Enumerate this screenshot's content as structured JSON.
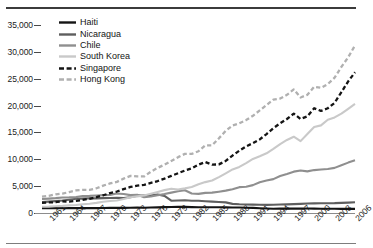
{
  "chart_data": {
    "type": "line",
    "title": "",
    "subtitle": "",
    "xlabel": "",
    "ylabel": "",
    "grid": false,
    "legend_position": "top-left",
    "ylim": [
      0,
      35000
    ],
    "yticks": [
      0,
      5000,
      10000,
      15000,
      20000,
      25000,
      30000,
      35000
    ],
    "ytick_labels": [
      "0",
      "5,000",
      "10,000",
      "15,000",
      "20,000",
      "25,000",
      "30,000",
      "35,000"
    ],
    "xlim": [
      1960,
      2006
    ],
    "xticks": [
      1961,
      1964,
      1967,
      1970,
      1973,
      1976,
      1979,
      1982,
      1985,
      1988,
      1991,
      1994,
      1997,
      2000,
      2003,
      2006
    ],
    "xtick_labels": [
      "1961",
      "1964",
      "1967",
      "1970",
      "1973",
      "1976",
      "1979",
      "1982",
      "1985",
      "1988",
      "1991",
      "1994",
      "1997",
      "2000",
      "2003",
      "2006"
    ],
    "x": [
      1960,
      1961,
      1962,
      1963,
      1964,
      1965,
      1966,
      1967,
      1968,
      1969,
      1970,
      1971,
      1972,
      1973,
      1974,
      1975,
      1976,
      1977,
      1978,
      1979,
      1980,
      1981,
      1982,
      1983,
      1984,
      1985,
      1986,
      1987,
      1988,
      1989,
      1990,
      1991,
      1992,
      1993,
      1994,
      1995,
      1996,
      1997,
      1998,
      1999,
      2000,
      2001,
      2002,
      2003,
      2004,
      2005,
      2006
    ],
    "series": [
      {
        "name": "Haiti",
        "color": "#141414",
        "style": "solid",
        "width": 2.1,
        "values": [
          900,
          905,
          900,
          890,
          900,
          910,
          905,
          900,
          910,
          930,
          950,
          960,
          950,
          980,
          1000,
          990,
          1030,
          1050,
          1090,
          1120,
          1160,
          1140,
          1100,
          1080,
          1080,
          1070,
          1060,
          1040,
          1020,
          1020,
          980,
          950,
          880,
          830,
          780,
          810,
          810,
          820,
          820,
          830,
          820,
          800,
          780,
          780,
          760,
          760,
          770
        ]
      },
      {
        "name": "Nicaragua",
        "color": "#5e5e5e",
        "style": "solid",
        "width": 2.1,
        "values": [
          2050,
          2120,
          2220,
          2320,
          2480,
          2650,
          2680,
          2740,
          2720,
          2760,
          2800,
          2830,
          2790,
          2930,
          3230,
          3240,
          3300,
          3440,
          3190,
          2290,
          2320,
          2370,
          2270,
          2290,
          2200,
          2120,
          2050,
          1980,
          1700,
          1620,
          1590,
          1550,
          1540,
          1520,
          1540,
          1580,
          1610,
          1650,
          1690,
          1760,
          1800,
          1810,
          1810,
          1830,
          1880,
          1930,
          1990
        ]
      },
      {
        "name": "Chile",
        "color": "#8f8f8f",
        "style": "solid",
        "width": 2.1,
        "values": [
          2600,
          2680,
          2760,
          2880,
          2900,
          2960,
          3150,
          3180,
          3260,
          3330,
          3370,
          3620,
          3540,
          3330,
          3400,
          2940,
          3060,
          3310,
          3520,
          3790,
          4060,
          4240,
          3620,
          3560,
          3750,
          3790,
          3970,
          4160,
          4430,
          4810,
          4880,
          5190,
          5740,
          6060,
          6310,
          6890,
          7280,
          7700,
          7910,
          7750,
          7990,
          8110,
          8180,
          8400,
          8900,
          9380,
          9800
        ]
      },
      {
        "name": "South Korea",
        "color": "#c9c9c9",
        "style": "solid",
        "width": 2.1,
        "values": [
          1150,
          1180,
          1250,
          1320,
          1420,
          1480,
          1620,
          1710,
          1880,
          2080,
          2220,
          2340,
          2620,
          2920,
          3090,
          3250,
          3590,
          3930,
          4260,
          4530,
          4380,
          4590,
          4830,
          5340,
          5750,
          6050,
          6680,
          7380,
          8110,
          8580,
          9290,
          10060,
          10560,
          11110,
          11950,
          12840,
          13600,
          14200,
          13380,
          14690,
          16000,
          16310,
          17360,
          17790,
          18500,
          19400,
          20300
        ]
      },
      {
        "name": "Singapore",
        "color": "#141414",
        "style": "dashed",
        "width": 2.3,
        "values": [
          1900,
          1960,
          2010,
          2180,
          2110,
          2250,
          2450,
          2650,
          2950,
          3300,
          3700,
          4000,
          4450,
          4850,
          5100,
          5250,
          5600,
          5950,
          6400,
          6900,
          7400,
          7900,
          8300,
          9000,
          9500,
          9000,
          9050,
          9700,
          10700,
          11600,
          12400,
          13000,
          13700,
          14700,
          15800,
          16700,
          17500,
          18500,
          17500,
          18000,
          19500,
          19000,
          19500,
          20500,
          22500,
          24500,
          26200
        ]
      },
      {
        "name": "Hong Kong",
        "color": "#b0b0b0",
        "style": "dashed",
        "width": 2.3,
        "values": [
          3050,
          3200,
          3480,
          3600,
          3900,
          4200,
          4300,
          4300,
          4600,
          5100,
          5500,
          5800,
          6400,
          6900,
          6800,
          6800,
          7700,
          8400,
          9000,
          9700,
          10400,
          11000,
          11000,
          11500,
          12600,
          12600,
          13900,
          15300,
          16300,
          16700,
          17300,
          18100,
          19100,
          20100,
          21100,
          21300,
          22000,
          23000,
          21500,
          22000,
          23500,
          23300,
          24000,
          25200,
          27200,
          29000,
          31200
        ]
      }
    ]
  },
  "legend": {
    "items": [
      {
        "label": "Haiti"
      },
      {
        "label": "Nicaragua"
      },
      {
        "label": "Chile"
      },
      {
        "label": "South Korea"
      },
      {
        "label": "Singapore"
      },
      {
        "label": "Hong Kong"
      }
    ]
  }
}
